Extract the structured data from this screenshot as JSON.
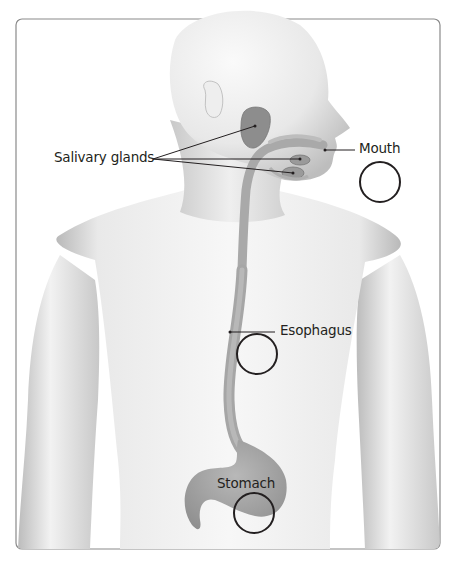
{
  "diagram": {
    "frame_color": "#8a8a8a",
    "organ_color": "#9a9a9a",
    "skin_color": "#e6e6e6",
    "labels": [
      {
        "id": "salivary-glands",
        "text": "Salivary glands"
      },
      {
        "id": "mouth",
        "text": "Mouth"
      },
      {
        "id": "esophagus",
        "text": "Esophagus"
      },
      {
        "id": "stomach",
        "text": "Stomach"
      }
    ],
    "answer_circles": [
      {
        "id": "mouth-circle",
        "for": "Mouth",
        "value": ""
      },
      {
        "id": "esophagus-circle",
        "for": "Esophagus",
        "value": ""
      },
      {
        "id": "stomach-circle",
        "for": "Stomach",
        "value": ""
      }
    ]
  }
}
